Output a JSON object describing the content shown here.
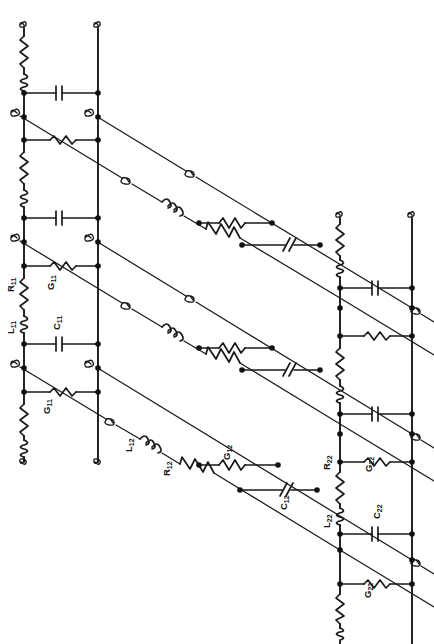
{
  "figure": {
    "domain": "circuit-schematic",
    "rotation_note": "Diagram and all labels are rotated 90 degrees (labels read bottom-to-top)",
    "background_color": "#ffffff",
    "ink_color": "#1a1a1a"
  },
  "labels": {
    "R11": "R",
    "R11_sub": "11",
    "L11": "L",
    "L11_sub": "11",
    "G11": "G",
    "G11_sub": "11",
    "C11": "C",
    "C11_sub": "11",
    "G11b": "G",
    "G11b_sub": "11",
    "L12": "L",
    "L12_sub": "12",
    "R12": "R",
    "R12_sub": "12",
    "G12": "G",
    "G12_sub": "12",
    "C12": "C",
    "C12_sub": "12",
    "R22": "R",
    "R22_sub": "22",
    "L22": "L",
    "L22_sub": "22",
    "G22": "G",
    "G22_sub": "22",
    "C22": "C",
    "C22_sub": "22",
    "G22b": "G",
    "G22b_sub": "22"
  },
  "label_list": [
    {
      "id": "R11",
      "text": "R",
      "sub": "11",
      "x": 14,
      "y": 290,
      "element": "resistor",
      "rail": "left-vertical-rail-1"
    },
    {
      "id": "L11",
      "text": "L",
      "sub": "11",
      "x": 14,
      "y": 322,
      "element": "inductor",
      "rail": "left-vertical-rail-1"
    },
    {
      "id": "G11",
      "text": "G",
      "sub": "11",
      "x": 52,
      "y": 290,
      "element": "resistor",
      "rail": "rung-horizontal"
    },
    {
      "id": "C11",
      "text": "C",
      "sub": "11",
      "x": 58,
      "y": 325,
      "element": "capacitor",
      "rail": "rung-horizontal"
    },
    {
      "id": "G11b",
      "text": "G",
      "sub": "11",
      "x": 48,
      "y": 400,
      "element": "resistor",
      "rail": "rung-horizontal"
    },
    {
      "id": "L12",
      "text": "L",
      "sub": "12",
      "x": 131,
      "y": 438,
      "element": "inductor",
      "rail": "diagonal-rail"
    },
    {
      "id": "R12",
      "text": "R",
      "sub": "12",
      "x": 166,
      "y": 458,
      "element": "resistor",
      "rail": "diagonal-rail"
    },
    {
      "id": "G12",
      "text": "G",
      "sub": "12",
      "x": 228,
      "y": 452,
      "element": "resistor",
      "rail": "diagonal-rung"
    },
    {
      "id": "C12",
      "text": "C",
      "sub": "12",
      "x": 285,
      "y": 492,
      "element": "capacitor",
      "rail": "diagonal-rung"
    },
    {
      "id": "R22",
      "text": "R",
      "sub": "22",
      "x": 330,
      "y": 462,
      "element": "resistor",
      "rail": "right-vertical-rail-1"
    },
    {
      "id": "L22",
      "text": "L",
      "sub": "22",
      "x": 330,
      "y": 512,
      "element": "inductor",
      "rail": "right-vertical-rail-1"
    },
    {
      "id": "G22",
      "text": "G",
      "sub": "22",
      "x": 371,
      "y": 462,
      "element": "resistor",
      "rail": "rung-horizontal"
    },
    {
      "id": "C22",
      "text": "C",
      "sub": "22",
      "x": 380,
      "y": 503,
      "element": "capacitor",
      "rail": "rung-horizontal"
    },
    {
      "id": "G22b",
      "text": "G",
      "sub": "22",
      "x": 370,
      "y": 588,
      "element": "resistor",
      "rail": "rung-horizontal"
    }
  ],
  "circuit": {
    "vertical_rails": [
      {
        "name": "left-rail-inner",
        "x": 24,
        "y_top": 18,
        "y_bottom": 462,
        "side": "port-1"
      },
      {
        "name": "left-rail-outer",
        "x": 98,
        "y_top": 18,
        "y_bottom": 462,
        "side": "port-1"
      },
      {
        "name": "right-rail-inner",
        "x": 340,
        "y_top": 208,
        "y_bottom": 640,
        "side": "port-2"
      },
      {
        "name": "right-rail-outer",
        "x": 412,
        "y_top": 208,
        "y_bottom": 640,
        "side": "port-2"
      }
    ],
    "series_elements_per_section": [
      "resistor",
      "inductor"
    ],
    "shunt_elements_per_section": [
      "resistor",
      "capacitor"
    ],
    "diagonal_rails": 4,
    "diagonal_series_elements": [
      "wire-break",
      "inductor",
      "resistor"
    ],
    "diagonal_shunt_rungs": [
      "resistor",
      "capacitor"
    ],
    "sections_left": 2,
    "sections_right": 2,
    "node_dot_radius": 2.6,
    "diagonal_slope_dy_dx": 0.605
  },
  "symbols": {
    "resistor": "zigzag",
    "inductor": "coil",
    "capacitor": "parallel-plates",
    "wire_break": "s-squiggle",
    "node": "filled-dot"
  }
}
